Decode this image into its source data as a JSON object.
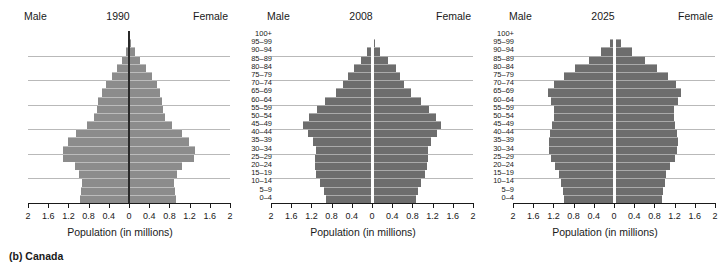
{
  "caption": "(b) Canada",
  "labels": {
    "male": "Male",
    "female": "Female",
    "axis_title": "Population (in millions)"
  },
  "age_groups": [
    "100+",
    "95–99",
    "90–94",
    "85–89",
    "80–84",
    "75–79",
    "70–74",
    "65–69",
    "60–64",
    "55–59",
    "50–54",
    "45–49",
    "40–44",
    "35–39",
    "30–34",
    "25–29",
    "20–24",
    "15–19",
    "10–14",
    "5–9",
    "0–4"
  ],
  "colors": {
    "bar_light": "#8c8c8c",
    "bar_dark": "#6d6d6d",
    "gridline": "#b9b9b9",
    "axis": "#1a1a1a",
    "background": "#ffffff"
  },
  "chart_data": [
    {
      "type": "bar",
      "subtype": "population-pyramid",
      "title": "1990",
      "xlabel": "Population (in millions)",
      "ylabel": "",
      "xlim": [
        -2,
        2
      ],
      "xticks": [
        "2",
        "1.6",
        "1.2",
        "0.8",
        "0.4",
        "0",
        "0.4",
        "0.8",
        "1.2",
        "1.6",
        "2"
      ],
      "xtick_values": [
        2,
        1.6,
        1.2,
        0.8,
        0.4,
        0,
        0.4,
        0.8,
        1.2,
        1.6,
        2
      ],
      "grid": true,
      "legend": "none",
      "categories": [
        "0–4",
        "5–9",
        "10–14",
        "15–19",
        "20–24",
        "25–29",
        "30–34",
        "35–39",
        "40–44",
        "45–49",
        "50–54",
        "55–59",
        "60–64",
        "65–69",
        "70–74",
        "75–79",
        "80–84",
        "85–89",
        "90–94",
        "95–99",
        "100+"
      ],
      "series": [
        {
          "name": "Male",
          "side": "left",
          "values": [
            0.97,
            0.95,
            0.94,
            0.99,
            1.07,
            1.3,
            1.31,
            1.2,
            1.04,
            0.84,
            0.7,
            0.64,
            0.61,
            0.54,
            0.45,
            0.34,
            0.23,
            0.13,
            0.05,
            0.015,
            0.003
          ]
        },
        {
          "name": "Female",
          "side": "right",
          "values": [
            0.93,
            0.91,
            0.9,
            0.95,
            1.05,
            1.28,
            1.3,
            1.19,
            1.04,
            0.85,
            0.72,
            0.67,
            0.66,
            0.61,
            0.55,
            0.45,
            0.34,
            0.22,
            0.11,
            0.035,
            0.007
          ]
        }
      ]
    },
    {
      "type": "bar",
      "subtype": "population-pyramid",
      "title": "2008",
      "xlabel": "Population (in millions)",
      "ylabel": "",
      "xlim": [
        -2,
        2
      ],
      "xticks": [
        "2",
        "1.6",
        "1.2",
        "0.8",
        "0.4",
        "0",
        "0.4",
        "0.8",
        "1.2",
        "1.6",
        "2"
      ],
      "xtick_values": [
        2,
        1.6,
        1.2,
        0.8,
        0.4,
        0,
        0.4,
        0.8,
        1.2,
        1.6,
        2
      ],
      "grid": true,
      "legend": "none",
      "categories": [
        "0–4",
        "5–9",
        "10–14",
        "15–19",
        "20–24",
        "25–29",
        "30–34",
        "35–39",
        "40–44",
        "45–49",
        "50–54",
        "55–59",
        "60–64",
        "65–69",
        "70–74",
        "75–79",
        "80–84",
        "85–89",
        "90–94",
        "95–99",
        "100+"
      ],
      "series": [
        {
          "name": "Male",
          "side": "left",
          "values": [
            0.91,
            0.95,
            1.03,
            1.1,
            1.12,
            1.12,
            1.11,
            1.16,
            1.27,
            1.36,
            1.25,
            1.09,
            0.94,
            0.72,
            0.57,
            0.47,
            0.35,
            0.21,
            0.09,
            0.025,
            0.004
          ]
        },
        {
          "name": "Female",
          "side": "right",
          "values": [
            0.87,
            0.91,
            0.98,
            1.05,
            1.08,
            1.1,
            1.11,
            1.17,
            1.28,
            1.37,
            1.26,
            1.12,
            0.98,
            0.77,
            0.63,
            0.56,
            0.47,
            0.32,
            0.16,
            0.05,
            0.009
          ]
        }
      ]
    },
    {
      "type": "bar",
      "subtype": "population-pyramid",
      "title": "2025",
      "xlabel": "Population (in millions)",
      "ylabel": "",
      "xlim": [
        -2,
        2
      ],
      "xticks": [
        "2",
        "1.6",
        "1.2",
        "0.8",
        "0.4",
        "0",
        "0.4",
        "0.8",
        "1.2",
        "1.6",
        "2"
      ],
      "xtick_values": [
        2,
        1.6,
        1.2,
        0.8,
        0.4,
        0,
        0.4,
        0.8,
        1.2,
        1.6,
        2
      ],
      "grid": true,
      "legend": "none",
      "categories": [
        "0–4",
        "5–9",
        "10–14",
        "15–19",
        "20–24",
        "25–29",
        "30–34",
        "35–39",
        "40–44",
        "45–49",
        "50–54",
        "55–59",
        "60–64",
        "65–69",
        "70–74",
        "75–79",
        "80–84",
        "85–89",
        "90–94",
        "95–99",
        "100+"
      ],
      "series": [
        {
          "name": "Male",
          "side": "left",
          "values": [
            1.0,
            1.02,
            1.05,
            1.08,
            1.16,
            1.25,
            1.29,
            1.29,
            1.26,
            1.23,
            1.19,
            1.18,
            1.25,
            1.3,
            1.18,
            1.0,
            0.77,
            0.5,
            0.26,
            0.08,
            0.012
          ]
        },
        {
          "name": "Female",
          "side": "right",
          "values": [
            0.95,
            0.97,
            1.0,
            1.03,
            1.11,
            1.2,
            1.25,
            1.26,
            1.24,
            1.21,
            1.18,
            1.18,
            1.26,
            1.32,
            1.22,
            1.07,
            0.86,
            0.61,
            0.35,
            0.13,
            0.025
          ]
        }
      ]
    }
  ]
}
